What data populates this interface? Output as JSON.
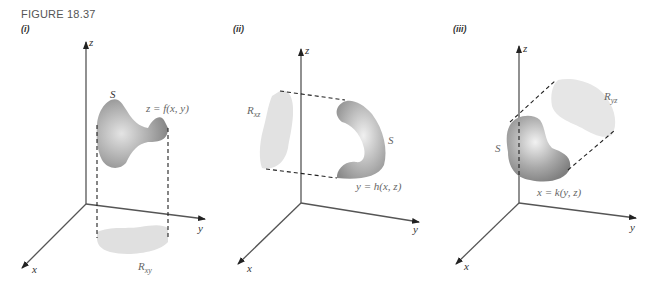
{
  "figure": {
    "title": "FIGURE 18.37",
    "panels": [
      {
        "label": "(i)",
        "axes": {
          "z": "z",
          "y": "y",
          "x": "x"
        },
        "surface_label": "S",
        "equation": "z = f(x, y)",
        "region_label": "R",
        "region_subscript": "xy"
      },
      {
        "label": "(ii)",
        "axes": {
          "z": "z",
          "y": "y",
          "x": "x"
        },
        "surface_label": "S",
        "equation": "y = h(x, z)",
        "region_label": "R",
        "region_subscript": "xz"
      },
      {
        "label": "(iii)",
        "axes": {
          "z": "z",
          "y": "y",
          "x": "x"
        },
        "surface_label": "S",
        "equation": "x = k(y, z)",
        "region_label": "R",
        "region_subscript": "yz"
      }
    ]
  }
}
